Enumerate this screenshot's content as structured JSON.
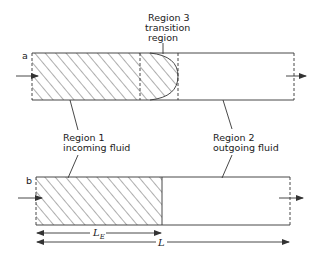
{
  "diagram": {
    "panels": [
      {
        "id": "a",
        "label": "a",
        "regions": [
          {
            "name": "Region 1",
            "description": "incoming fluid",
            "fill": "hatched"
          },
          {
            "name": "Region 3",
            "description": "transition region",
            "fill": "hatched semi-elliptical front"
          },
          {
            "name": "Region 2",
            "description": "outgoing fluid",
            "fill": "empty"
          }
        ]
      },
      {
        "id": "b",
        "label": "b",
        "regions": [
          {
            "name": "Region 1",
            "description": "incoming fluid",
            "fill": "hatched"
          },
          {
            "name": "Region 2",
            "description": "outgoing fluid",
            "fill": "empty"
          }
        ]
      }
    ],
    "labels": {
      "region3_line1": "Region 3",
      "region3_line2": "transition",
      "region3_line3": "region",
      "region1_line1": "Region 1",
      "region1_line2": "incoming fluid",
      "region2_line1": "Region 2",
      "region2_line2": "outgoing fluid",
      "panel_a": "a",
      "panel_b": "b",
      "dim_entry": "L",
      "dim_entry_sub": "E",
      "dim_total": "L"
    },
    "colors": {
      "line": "#333333",
      "background": "#ffffff"
    }
  }
}
